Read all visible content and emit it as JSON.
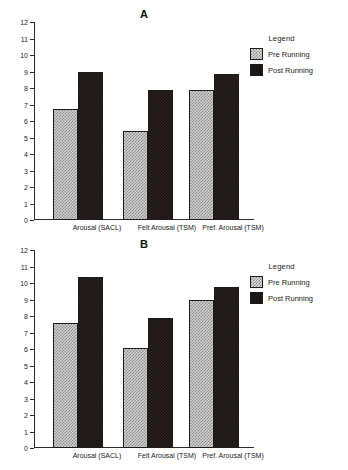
{
  "top_fragment": "",
  "legend": {
    "title": "Legend",
    "entries": [
      {
        "label": "Pre Running",
        "swatch": "light-hatched"
      },
      {
        "label": "Post Running",
        "swatch": "dark-hatched"
      }
    ]
  },
  "panels": [
    {
      "label": "A"
    },
    {
      "label": "B"
    }
  ],
  "chart_data": [
    {
      "type": "bar",
      "title": "A",
      "categories": [
        "Arousal (SACL)",
        "Felt Arousal (TSM)",
        "Pref. Arousal (TSM)"
      ],
      "series": [
        {
          "name": "Pre Running",
          "values": [
            6.7,
            5.4,
            7.9
          ]
        },
        {
          "name": "Post Running",
          "values": [
            9.0,
            7.9,
            8.85
          ]
        }
      ],
      "xlabel": "",
      "ylabel": "",
      "ylim": [
        0,
        12
      ],
      "yticks": [
        0,
        1,
        2,
        3,
        4,
        5,
        6,
        7,
        8,
        9,
        10,
        11,
        12
      ],
      "grid": false,
      "legend_position": "right"
    },
    {
      "type": "bar",
      "title": "B",
      "categories": [
        "Arousal (SACL)",
        "Felt Arousal (TSM)",
        "Pref. Arousal (TSM)"
      ],
      "series": [
        {
          "name": "Pre Running",
          "values": [
            7.6,
            6.05,
            8.95
          ]
        },
        {
          "name": "Post Running",
          "values": [
            10.35,
            7.85,
            9.75
          ]
        }
      ],
      "xlabel": "",
      "ylabel": "",
      "ylim": [
        0,
        12
      ],
      "yticks": [
        0,
        1,
        2,
        3,
        4,
        5,
        6,
        7,
        8,
        9,
        10,
        11,
        12
      ],
      "grid": false,
      "legend_position": "right"
    }
  ]
}
